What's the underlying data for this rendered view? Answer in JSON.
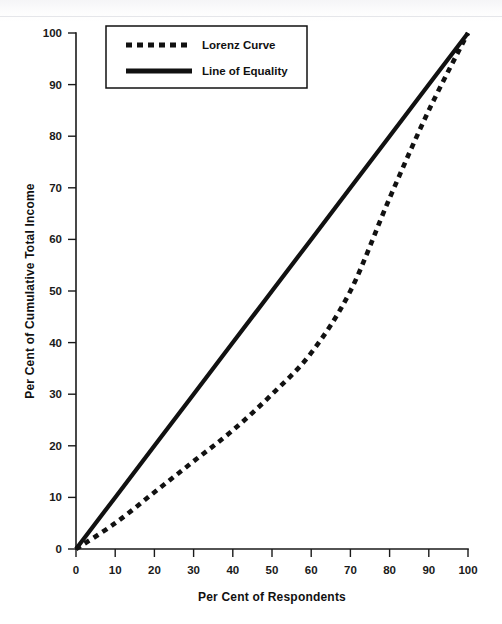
{
  "chart_data": {
    "type": "line",
    "title": "",
    "subtitle": "",
    "xlabel": "Per Cent of Respondents",
    "ylabel": "Per Cent of Cumulative Total Income",
    "xlim": [
      0,
      100
    ],
    "ylim": [
      0,
      100
    ],
    "xticks": [
      0,
      10,
      20,
      30,
      40,
      50,
      60,
      70,
      80,
      90,
      100
    ],
    "yticks": [
      0,
      10,
      20,
      30,
      40,
      50,
      60,
      70,
      80,
      90,
      100
    ],
    "grid": false,
    "legend_position": "upper-left-inside",
    "x": [
      0,
      10,
      20,
      30,
      40,
      50,
      60,
      70,
      80,
      90,
      100
    ],
    "series": [
      {
        "name": "Lorenz Curve",
        "style": "dashed",
        "color": "#111111",
        "values": [
          0,
          5,
          11,
          17,
          23,
          30,
          38,
          50,
          68,
          85,
          100
        ]
      },
      {
        "name": "Line of Equality",
        "style": "solid",
        "color": "#111111",
        "values": [
          0,
          10,
          20,
          30,
          40,
          50,
          60,
          70,
          80,
          90,
          100
        ]
      }
    ]
  },
  "axes": {
    "x_tick_labels": [
      "0",
      "10",
      "20",
      "30",
      "40",
      "50",
      "60",
      "70",
      "80",
      "90",
      "100"
    ],
    "y_tick_labels": [
      "0",
      "10",
      "20",
      "30",
      "40",
      "50",
      "60",
      "70",
      "80",
      "90",
      "100"
    ],
    "x_title": "Per Cent of Respondents",
    "y_title": "Per Cent of Cumulative Total Income"
  },
  "legend": {
    "items": [
      {
        "label": "Lorenz Curve",
        "style": "dashed"
      },
      {
        "label": "Line of Equality",
        "style": "solid"
      }
    ]
  }
}
